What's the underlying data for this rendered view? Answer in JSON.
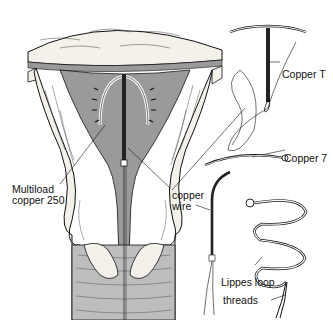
{
  "figure": {
    "labels": {
      "multiload_line1": "Multiload",
      "multiload_line2": "copper 250",
      "copper_wire_line1": "copper",
      "copper_wire_line2": "wire",
      "copper_t": "Copper T",
      "copper_7": "Copper 7",
      "lippes_loop": "Lippes loop",
      "threads": "threads"
    },
    "colors": {
      "ink": "#111111",
      "tissue_fill": "#f4f1ea",
      "cavity_fill": "#9a9a9a",
      "muscle_fill": "#bdbdbd",
      "background": "#ffffff"
    }
  }
}
